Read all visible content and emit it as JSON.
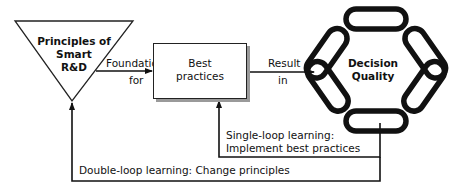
{
  "diagram": {
    "principles": {
      "line1": "Principles of",
      "line2": "Smart",
      "line3": "R&D"
    },
    "foundation_label": {
      "line1": "Foundation",
      "line2": "for"
    },
    "best_practices": {
      "line1": "Best",
      "line2": "practices"
    },
    "result_label": {
      "line1": "Result",
      "line2": "in"
    },
    "decision_quality": {
      "line1": "Decision",
      "line2": "Quality"
    },
    "single_loop": {
      "line1": "Single-loop learning:",
      "line2": "Implement best practices"
    },
    "double_loop": {
      "line1": "Double-loop learning: Change principles"
    }
  },
  "colors": {
    "stroke": "#111111",
    "shadow": "#9a9a9a",
    "background": "#ffffff"
  }
}
